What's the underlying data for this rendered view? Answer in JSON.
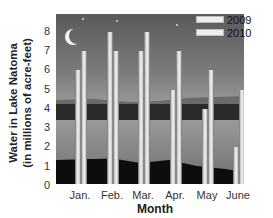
{
  "chart_data": {
    "type": "bar",
    "title": "",
    "xlabel": "Month",
    "ylabel": "Water in Lake Natoma (in millions of acre-feet)",
    "ylabel_lines": [
      "Water in Lake Natoma",
      "(in millions of acre-feet)"
    ],
    "categories": [
      "Jan.",
      "Feb.",
      "Mar.",
      "Apr.",
      "May",
      "June"
    ],
    "series": [
      {
        "name": "2009",
        "values": [
          6,
          8,
          7,
          5,
          4,
          2
        ]
      },
      {
        "name": "2010",
        "values": [
          7,
          7,
          8,
          7,
          6,
          5
        ]
      }
    ],
    "yticks": [
      "0",
      "1",
      "2",
      "3",
      "4",
      "5",
      "6",
      "7",
      "8"
    ],
    "ylim": [
      0,
      8.7
    ],
    "grid": false,
    "legend_position": "top-right",
    "background": "night-time lake photograph with moon"
  },
  "colors": {
    "bar_fill": "#eeeeee",
    "bar_edge": "#888888",
    "sky_top": "#5a5a5a",
    "sky_bottom": "#b5b5b5",
    "water": "#8e8e8e",
    "treeline": "#2a2a2a",
    "foreground": "#0d0d0d"
  }
}
